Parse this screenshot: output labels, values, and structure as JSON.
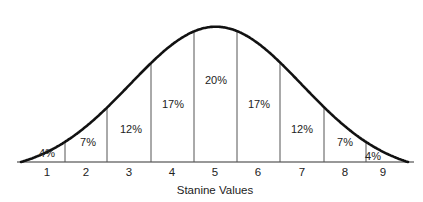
{
  "chart_data": {
    "type": "area",
    "title": "",
    "xlabel": "Stanine Values",
    "ylabel": "",
    "categories": [
      "1",
      "2",
      "3",
      "4",
      "5",
      "6",
      "7",
      "8",
      "9"
    ],
    "values": [
      4,
      7,
      12,
      17,
      20,
      17,
      12,
      7,
      4
    ],
    "value_labels": [
      "4%",
      "7%",
      "12%",
      "17%",
      "20%",
      "17%",
      "12%",
      "7%",
      "4%"
    ],
    "units": "percent",
    "grid": false,
    "legend": null
  },
  "colors": {
    "curve": "#111111",
    "dividers": "#555555",
    "axis": "#333333",
    "text": "#222222",
    "background": "#ffffff"
  }
}
